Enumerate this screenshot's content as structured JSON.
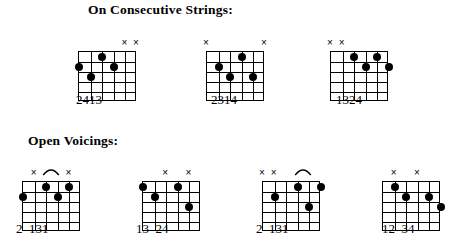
{
  "page": {
    "background_color": "#ffffff",
    "ink_color": "#000000",
    "width": 462,
    "height": 250
  },
  "sections": [
    {
      "id": "consecutive",
      "title": "On Consecutive Strings:",
      "diagrams": [
        {
          "id": "consecutive-1",
          "strings": 6,
          "frets": 5,
          "mutes": [
            "×",
            "×"
          ],
          "mute_strings": [
            5,
            6
          ],
          "arc": false,
          "dots": [
            {
              "string": 1,
              "fret": 2
            },
            {
              "string": 2,
              "fret": 3
            },
            {
              "string": 3,
              "fret": 1
            },
            {
              "string": 4,
              "fret": 2
            }
          ],
          "fingering": "2413"
        },
        {
          "id": "consecutive-2",
          "strings": 6,
          "frets": 5,
          "mutes": [
            "×",
            "×"
          ],
          "mute_strings": [
            1,
            6
          ],
          "arc": false,
          "dots": [
            {
              "string": 2,
              "fret": 2
            },
            {
              "string": 3,
              "fret": 3
            },
            {
              "string": 4,
              "fret": 1
            },
            {
              "string": 5,
              "fret": 3
            }
          ],
          "fingering": "2314"
        },
        {
          "id": "consecutive-3",
          "strings": 6,
          "frets": 5,
          "mutes": [
            "×",
            "×"
          ],
          "mute_strings": [
            1,
            2
          ],
          "arc": false,
          "dots": [
            {
              "string": 3,
              "fret": 1
            },
            {
              "string": 4,
              "fret": 2
            },
            {
              "string": 5,
              "fret": 1
            },
            {
              "string": 6,
              "fret": 2
            }
          ],
          "fingering": "1324"
        }
      ]
    },
    {
      "id": "open",
      "title": "Open Voicings:",
      "diagrams": [
        {
          "id": "open-1",
          "strings": 6,
          "frets": 5,
          "mutes": [
            "×",
            "×"
          ],
          "mute_strings": [
            2,
            5
          ],
          "arc": true,
          "dots": [
            {
              "string": 1,
              "fret": 2
            },
            {
              "string": 3,
              "fret": 1
            },
            {
              "string": 4,
              "fret": 2
            },
            {
              "string": 5,
              "fret": 1
            }
          ],
          "fingering": "2  131"
        },
        {
          "id": "open-2",
          "strings": 6,
          "frets": 5,
          "mutes": [
            "×",
            "×"
          ],
          "mute_strings": [
            3,
            5
          ],
          "arc": false,
          "dots": [
            {
              "string": 1,
              "fret": 1
            },
            {
              "string": 2,
              "fret": 2
            },
            {
              "string": 4,
              "fret": 1
            },
            {
              "string": 5,
              "fret": 3
            }
          ],
          "fingering": "13  24"
        },
        {
          "id": "open-3",
          "strings": 6,
          "frets": 5,
          "mutes": [
            "×",
            "×"
          ],
          "mute_strings": [
            1,
            2
          ],
          "arc": true,
          "dots": [
            {
              "string": 2,
              "fret": 2
            },
            {
              "string": 4,
              "fret": 1
            },
            {
              "string": 5,
              "fret": 3
            },
            {
              "string": 6,
              "fret": 1
            }
          ],
          "fingering": "2  131"
        },
        {
          "id": "open-4",
          "strings": 6,
          "frets": 5,
          "mutes": [
            "×",
            "×"
          ],
          "mute_strings": [
            2,
            4
          ],
          "arc": false,
          "dots": [
            {
              "string": 2,
              "fret": 1
            },
            {
              "string": 3,
              "fret": 2
            },
            {
              "string": 5,
              "fret": 2
            },
            {
              "string": 6,
              "fret": 3
            }
          ],
          "fingering": "12  34"
        }
      ]
    }
  ],
  "geometry": {
    "consecutive": [
      {
        "left": 78,
        "top": 38,
        "w": 58,
        "h": 50,
        "fingers_left": 76,
        "fingers_top": 93
      },
      {
        "left": 206,
        "top": 38,
        "w": 58,
        "h": 50,
        "fingers_left": 211,
        "fingers_top": 93
      },
      {
        "left": 330,
        "top": 38,
        "w": 58,
        "h": 50,
        "fingers_left": 336,
        "fingers_top": 93
      },
      {
        "left": 0,
        "top": 0,
        "w": 0,
        "h": 0,
        "fingers_left": 0,
        "fingers_top": 0
      }
    ],
    "open": [
      {
        "left": 22,
        "top": 168,
        "w": 58,
        "h": 50,
        "fingers_left": 16,
        "fingers_top": 222
      },
      {
        "left": 142,
        "top": 168,
        "w": 58,
        "h": 50,
        "fingers_left": 136,
        "fingers_top": 222
      },
      {
        "left": 262,
        "top": 168,
        "w": 58,
        "h": 50,
        "fingers_left": 256,
        "fingers_top": 222
      },
      {
        "left": 382,
        "top": 168,
        "w": 58,
        "h": 50,
        "fingers_left": 382,
        "fingers_top": 222
      }
    ]
  }
}
